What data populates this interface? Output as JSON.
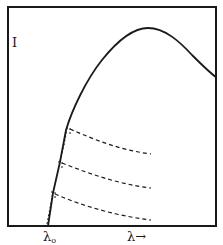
{
  "figure": {
    "y_axis_label": "I",
    "x_axis_label": "λ→",
    "x_origin_label": "λ",
    "x_origin_subscript": "o",
    "colors": {
      "background": "#ffffff",
      "ink": "#1a1a1a"
    },
    "curves": {
      "main": "solid intensity curve rising from λo, peaking and falling off to the right",
      "dashed": [
        "upper dashed branch",
        "middle dashed branch",
        "lower dashed branch"
      ]
    }
  }
}
